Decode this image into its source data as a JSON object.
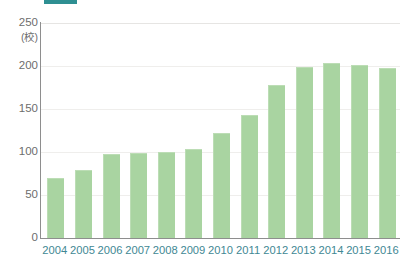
{
  "accent": {
    "color": "#2e8f92",
    "name": "header-accent-bar"
  },
  "chart_data": {
    "type": "bar",
    "title": "",
    "subtitle": "",
    "xlabel": "",
    "ylabel": "",
    "unit_label": "(校)",
    "categories": [
      "2004",
      "2005",
      "2006",
      "2007",
      "2008",
      "2009",
      "2010",
      "2011",
      "2012",
      "2013",
      "2014",
      "2015",
      "2016"
    ],
    "values": [
      70,
      79,
      98,
      99,
      100,
      103,
      122,
      143,
      178,
      199,
      203,
      201,
      198
    ],
    "series": [
      {
        "name": "",
        "values": [
          70,
          79,
          98,
          99,
          100,
          103,
          122,
          143,
          178,
          199,
          203,
          201,
          198
        ]
      }
    ],
    "ylim": [
      0,
      250
    ],
    "ytick_values": [
      0,
      50,
      100,
      150,
      200,
      250
    ],
    "ytick_labels": [
      "0",
      "50",
      "100",
      "150",
      "200",
      "250"
    ],
    "grid": true,
    "legend": false,
    "legend_position": "none",
    "bar_color": "#a9d4a1",
    "axis_label_color": "#3f8894",
    "ytick_color": "#6d6d6d"
  }
}
